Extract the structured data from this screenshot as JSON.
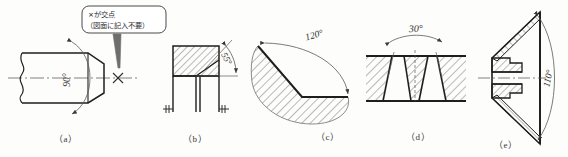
{
  "figure": {
    "title_visible": false,
    "background_color": "#fdfdfb",
    "line_color": "#1e1e1e",
    "thin_line_color": "#5a5a5a",
    "panel_count": 5
  },
  "callout": {
    "line1": "×が交点",
    "line2": "（図面に記入不要）",
    "shape": "rounded-rectangle",
    "leader": "tapered-leader-line",
    "points_to": "×-intersection-mark"
  },
  "panels": [
    {
      "id": "a",
      "caption": "（a）",
      "angle_label": "90°",
      "angle_value": 90,
      "label_rotation_deg": -90,
      "features": [
        "break-line",
        "center-line",
        "chamfered-shaft-end",
        "arc-dimension",
        "intersection-cross"
      ],
      "hatched": false
    },
    {
      "id": "b",
      "caption": "（b）",
      "angle_label": "55°",
      "angle_value": 55,
      "label_rotation_deg": -55,
      "features": [
        "section-hatching",
        "center-line",
        "arc-dimension",
        "short-hatch-ticks"
      ],
      "hatched": true
    },
    {
      "id": "c",
      "caption": "（c）",
      "angle_label": "120°",
      "angle_value": 120,
      "label_rotation_deg": -22,
      "features": [
        "section-hatching",
        "vee-profile",
        "arc-dimension"
      ],
      "hatched": true
    },
    {
      "id": "d",
      "caption": "（d）",
      "angle_label": "30°",
      "angle_value": 30,
      "label_rotation_deg": -6,
      "features": [
        "section-hatching",
        "plate-with-vee-groove",
        "arc-dimension",
        "extension-lines"
      ],
      "hatched": true
    },
    {
      "id": "e",
      "caption": "（e）",
      "angle_label": "110°",
      "angle_value": 110,
      "label_rotation_deg": -80,
      "features": [
        "section-hatching",
        "center-line",
        "countersunk-cone",
        "arc-dimension"
      ],
      "hatched": true
    }
  ]
}
